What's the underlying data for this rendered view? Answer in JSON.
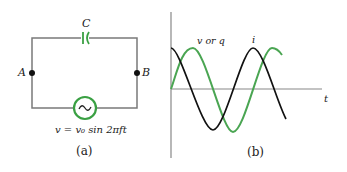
{
  "panel_a": {
    "caption": "(a)",
    "capacitor_label": "C",
    "node_a_label": "A",
    "node_b_label": "B",
    "source_symbol": "~",
    "source_equation": "v = v₀ sin 2πft",
    "colors": {
      "wire": "#7a7a7a",
      "component": "#3aa043",
      "node": "#111111"
    }
  },
  "panel_b": {
    "caption": "(b)",
    "curve_v_label": "v or q",
    "curve_i_label": "i",
    "axis_t_label": "t",
    "colors": {
      "curve_v": "#4aa552",
      "curve_i": "#111111",
      "axis": "#888888"
    }
  }
}
